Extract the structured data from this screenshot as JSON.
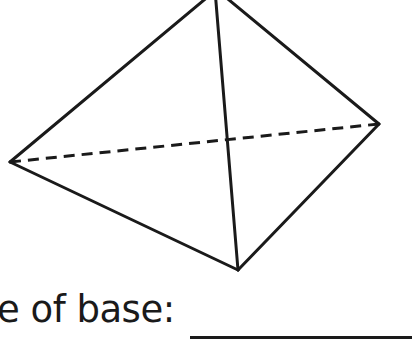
{
  "page": {
    "background_color": "#ffffff",
    "width": 412,
    "height": 351,
    "kind": "geometry-worksheet-question"
  },
  "figure": {
    "name": "triangular-pyramid",
    "stroke_color": "#1a1a1a",
    "stroke_width": 3,
    "dash_pattern": "11 7",
    "vertices": {
      "apex": [
        216,
        -10
      ],
      "left": [
        10,
        162
      ],
      "right": [
        379,
        124
      ],
      "front_bottom": [
        238,
        270
      ]
    },
    "solid_edges": [
      [
        "apex",
        "left"
      ],
      [
        "apex",
        "right"
      ],
      [
        "apex",
        "front_bottom"
      ],
      [
        "left",
        "front_bottom"
      ],
      [
        "right",
        "front_bottom"
      ]
    ],
    "hidden_edges": [
      [
        "left",
        "right"
      ]
    ]
  },
  "prompt": {
    "label": "e of base:",
    "full_label_inferred": "Shape of base:",
    "clipped_at_left": true,
    "answer_value": "",
    "answer_placeholder": ""
  }
}
